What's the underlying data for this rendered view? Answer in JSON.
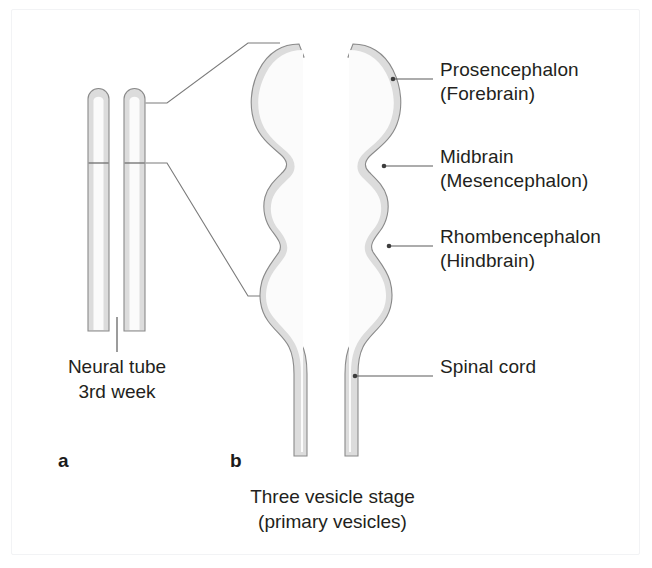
{
  "figure": {
    "background_color": "#ffffff",
    "frame_color": "#f2f3f5",
    "wall_fill_color": "#dcdcdc",
    "wall_outline_color": "#8a8a8a",
    "lumen_color": "#fbfbfb",
    "leader_line_color": "#5a5a5a",
    "text_color": "#231f20"
  },
  "panels": {
    "a": {
      "letter": "a",
      "caption_line1": "Neural tube",
      "caption_line2": "3rd week"
    },
    "b": {
      "letter": "b",
      "caption_line1": "Three vesicle stage",
      "caption_line2": "(primary vesicles)"
    }
  },
  "labels": [
    {
      "name": "prosencephalon",
      "line1": "Prosencephalon",
      "line2": "(Forebrain)"
    },
    {
      "name": "midbrain",
      "line1": "Midbrain",
      "line2": "(Mesencephalon)"
    },
    {
      "name": "rhombencephalon",
      "line1": "Rhombencephalon",
      "line2": "(Hindbrain)"
    },
    {
      "name": "spinal-cord",
      "line1": "Spinal cord",
      "line2": ""
    }
  ]
}
